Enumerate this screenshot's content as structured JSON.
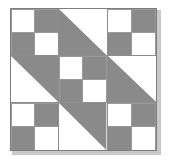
{
  "figure": {
    "kind": "quilt-block-diagram",
    "title": "",
    "grid_rows": 3,
    "grid_cols": 3,
    "colors": {
      "dark": "#8a8a8a",
      "light": "#ffffff",
      "gridline": "#8d8d8d",
      "border": "#7d7d7d",
      "shadow": "#c9c9c9",
      "background": "#ffffff"
    },
    "cells": [
      {
        "position": "top-left",
        "row": 0,
        "col": 0,
        "type": "four-patch",
        "patches": [
          "light",
          "dark",
          "dark",
          "light"
        ]
      },
      {
        "position": "top-center",
        "row": 0,
        "col": 1,
        "type": "half-square-triangle",
        "dark_corner": "bottom-left"
      },
      {
        "position": "top-right",
        "row": 0,
        "col": 2,
        "type": "four-patch",
        "patches": [
          "light",
          "dark",
          "dark",
          "light"
        ]
      },
      {
        "position": "middle-left",
        "row": 1,
        "col": 0,
        "type": "half-square-triangle",
        "dark_corner": "top-right"
      },
      {
        "position": "center",
        "row": 1,
        "col": 1,
        "type": "four-patch",
        "patches": [
          "light",
          "dark",
          "dark",
          "light"
        ]
      },
      {
        "position": "middle-right",
        "row": 1,
        "col": 2,
        "type": "half-square-triangle",
        "dark_corner": "bottom-left"
      },
      {
        "position": "bottom-left",
        "row": 2,
        "col": 0,
        "type": "four-patch",
        "patches": [
          "light",
          "dark",
          "dark",
          "light"
        ]
      },
      {
        "position": "bottom-center",
        "row": 2,
        "col": 1,
        "type": "half-square-triangle",
        "dark_corner": "top-right"
      },
      {
        "position": "bottom-right",
        "row": 2,
        "col": 2,
        "type": "four-patch",
        "patches": [
          "light",
          "dark",
          "dark",
          "light"
        ]
      }
    ]
  }
}
